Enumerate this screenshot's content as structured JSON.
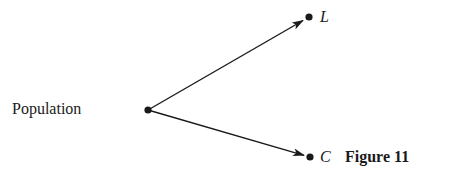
{
  "diagram": {
    "source": {
      "label": "Population",
      "point": [
        148,
        110
      ]
    },
    "targets": [
      {
        "id": "L",
        "label": "L",
        "point": [
          309,
          17
        ]
      },
      {
        "id": "C",
        "label": "C",
        "point": [
          310,
          157
        ]
      }
    ],
    "edges": [
      {
        "from": "Population",
        "to": "L"
      },
      {
        "from": "Population",
        "to": "C"
      }
    ],
    "caption": "Figure 11",
    "colors": {
      "stroke": "#1a1a1a",
      "background": "#ffffff"
    }
  }
}
